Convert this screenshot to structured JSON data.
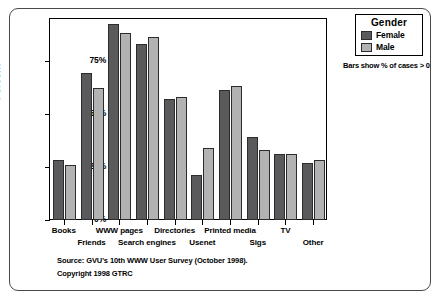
{
  "chart_data": {
    "type": "bar",
    "title": "",
    "xlabel": "",
    "ylabel": "Percent",
    "ylim": [
      0,
      100
    ],
    "yticks": [
      "0%",
      "25%",
      "50%",
      "75%"
    ],
    "ytick_values": [
      0,
      25,
      50,
      75
    ],
    "grid": false,
    "legend_position": "top-right",
    "categories": [
      "Books",
      "Friends",
      "WWW pages",
      "Search engines",
      "Directories",
      "Usenet",
      "Printed media",
      "Sigs",
      "TV",
      "Other"
    ],
    "series": [
      {
        "name": "Female",
        "color": "#5a5a5c",
        "values": [
          28,
          69,
          92,
          83,
          57,
          21,
          61,
          39,
          31,
          27
        ]
      },
      {
        "name": "Male",
        "color": "#b2b2b2",
        "values": [
          26,
          62,
          88,
          86,
          58,
          34,
          63,
          33,
          31,
          28
        ]
      }
    ],
    "annotations": [
      "Bars show % of cases > 0",
      "Source: GVU's 10th WWW User Survey (October 1998).",
      "Copyright 1998 GTRC"
    ]
  },
  "axes": {
    "y_title": "Percent",
    "y_ticks": [
      "75%",
      "50%",
      "25%",
      "0%"
    ]
  },
  "legend": {
    "title": "Gender",
    "items": [
      {
        "label": "Female",
        "color": "#5a5a5c"
      },
      {
        "label": "Male",
        "color": "#b2b2b2"
      }
    ],
    "note": "Bars show % of cases > 0"
  },
  "footer": {
    "source": "Source: GVU's 10th WWW User Survey (October 1998).",
    "copyright": "Copyright 1998 GTRC"
  }
}
